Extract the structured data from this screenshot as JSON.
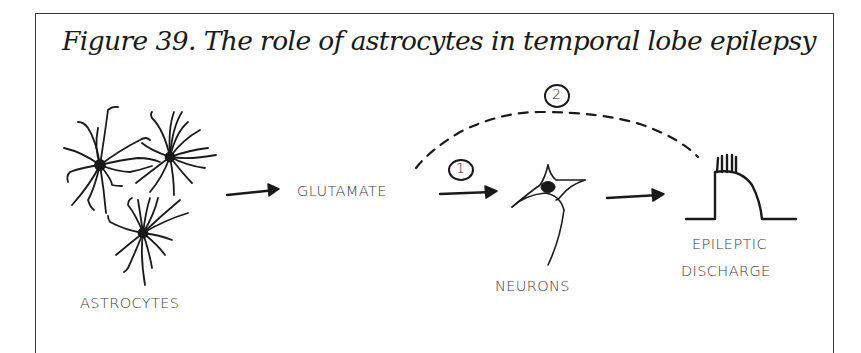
{
  "figure": {
    "title": "Figure 39.  The role of astrocytes in temporal lobe epilepsy",
    "labels": {
      "astrocytes": "ASTROCYTES",
      "glutamate": "GLUTAMATE",
      "neurons": "NEURONS",
      "epileptic": "EPILEPTIC",
      "discharge": "DISCHARGE"
    },
    "markers": {
      "pathway_1": "1",
      "pathway_2": "2"
    },
    "flow": [
      "ASTROCYTES",
      "GLUTAMATE",
      "NEURONS",
      "EPILEPTIC DISCHARGE"
    ],
    "pathways": [
      {
        "id": "1",
        "from": "GLUTAMATE",
        "to": "NEURONS",
        "style": "solid-arrow"
      },
      {
        "id": "2",
        "from": "GLUTAMATE",
        "to": "EPILEPTIC DISCHARGE",
        "style": "dashed-arc"
      }
    ],
    "ink_color": "#1a1a1a"
  }
}
